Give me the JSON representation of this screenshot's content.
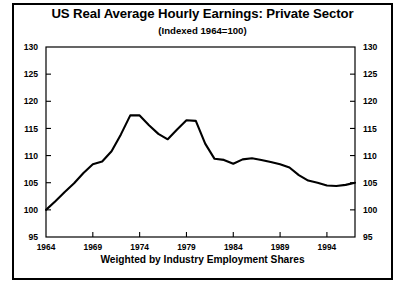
{
  "chart_data": {
    "type": "line",
    "title": "US Real Average Hourly Earnings:  Private Sector",
    "subtitle": "(Indexed 1964=100)",
    "caption": "Weighted by Industry Employment Shares",
    "xlabel": "",
    "ylabel": "",
    "xlim": [
      1964,
      1997
    ],
    "ylim": [
      95,
      130
    ],
    "grid": false,
    "legend": null,
    "line_color": "#000000",
    "axis_color": "#000000",
    "background_color": "#ffffff",
    "y_ticks": [
      95,
      100,
      105,
      110,
      115,
      120,
      125,
      130
    ],
    "y_ticks_right": [
      95,
      100,
      105,
      110,
      115,
      120,
      125,
      130
    ],
    "x_ticks": [
      1964,
      1969,
      1974,
      1979,
      1984,
      1989,
      1994
    ],
    "x_tick_labels": [
      "1964",
      "1969",
      "1974",
      "1979",
      "1984",
      "1989",
      "1994"
    ],
    "x": [
      1964,
      1965,
      1966,
      1967,
      1968,
      1969,
      1970,
      1971,
      1972,
      1973,
      1974,
      1975,
      1976,
      1977,
      1978,
      1979,
      1980,
      1981,
      1982,
      1983,
      1984,
      1985,
      1986,
      1987,
      1988,
      1989,
      1990,
      1991,
      1992,
      1993,
      1994,
      1995,
      1996,
      1997
    ],
    "values": [
      100.0,
      101.6,
      103.3,
      104.9,
      106.8,
      108.4,
      108.9,
      110.8,
      113.9,
      117.4,
      117.4,
      115.6,
      114.0,
      113.0,
      114.8,
      116.5,
      116.4,
      112.2,
      109.4,
      109.2,
      108.5,
      109.3,
      109.5,
      109.2,
      108.8,
      108.4,
      107.8,
      106.4,
      105.4,
      105.0,
      104.5,
      104.4,
      104.6,
      105.0
    ],
    "series_name": "US Real Average Hourly Earnings (Private Sector)",
    "annotations": []
  },
  "endpoint_values": {
    "start_year": 1964,
    "start_value": 100.0,
    "peak1_year": 1973,
    "peak1_value": 117.4,
    "trough_mid_year": 1977,
    "trough_mid_value": 113.0,
    "peak2_year": 1979,
    "peak2_value": 116.5,
    "final_year": 1997,
    "final_value": 106.3
  }
}
